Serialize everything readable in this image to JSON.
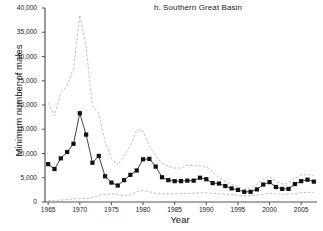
{
  "chart_data": {
    "type": "line",
    "title": "h. Southern Great Basin",
    "xlabel": "Year",
    "ylabel": "Minimum number of males",
    "xlim": [
      1964.5,
      2007.5
    ],
    "ylim": [
      0,
      40000
    ],
    "grid": false,
    "legend": null,
    "ytick_labels": [
      "0",
      "5,000",
      "10,000",
      "15,000",
      "20,000",
      "25,000",
      "30,000",
      "35,000",
      "40,000"
    ],
    "ytick_values": [
      0,
      5000,
      10000,
      15000,
      20000,
      25000,
      30000,
      35000,
      40000
    ],
    "xtick_labels": [
      "1965",
      "1970",
      "1975",
      "1980",
      "1985",
      "1990",
      "1995",
      "2000",
      "2005"
    ],
    "xtick_values": [
      1965,
      1970,
      1975,
      1980,
      1985,
      1990,
      1995,
      2000,
      2005
    ],
    "x": [
      1965,
      1966,
      1967,
      1968,
      1969,
      1970,
      1971,
      1972,
      1973,
      1974,
      1975,
      1976,
      1977,
      1978,
      1979,
      1980,
      1981,
      1982,
      1983,
      1984,
      1985,
      1986,
      1987,
      1988,
      1989,
      1990,
      1991,
      1992,
      1993,
      1994,
      1995,
      1996,
      1997,
      1998,
      1999,
      2000,
      2001,
      2002,
      2003,
      2004,
      2005,
      2006,
      2007
    ],
    "series": [
      {
        "name": "Minimum number of males",
        "style": "line-markers",
        "color": "#111111",
        "marker": "square",
        "values": [
          7800,
          6800,
          9000,
          10300,
          12000,
          18300,
          13900,
          8100,
          9500,
          5300,
          4000,
          3400,
          4500,
          5600,
          6500,
          8800,
          8900,
          7300,
          5100,
          4500,
          4300,
          4300,
          4400,
          4400,
          5000,
          4700,
          3900,
          3800,
          3300,
          2800,
          2500,
          2100,
          2100,
          2600,
          3600,
          4100,
          3100,
          2700,
          2700,
          3700,
          4300,
          4600,
          4200
        ]
      },
      {
        "name": "Upper confidence limit",
        "style": "dashed",
        "color": "#b8b8b8",
        "values": [
          20500,
          17800,
          22500,
          24000,
          27500,
          38500,
          32000,
          19800,
          18300,
          12400,
          9000,
          7600,
          9500,
          11600,
          14900,
          14600,
          11500,
          9500,
          8000,
          7400,
          7000,
          7000,
          7600,
          7400,
          7500,
          7300,
          6300,
          5000,
          4300,
          3600,
          3100,
          2700,
          2900,
          3700,
          4800,
          5300,
          4200,
          3700,
          3900,
          4900,
          5500,
          5700,
          5400
        ]
      },
      {
        "name": "Lower confidence limit",
        "style": "dashed",
        "color": "#b8b8b8",
        "values": [
          300,
          300,
          400,
          500,
          600,
          800,
          700,
          900,
          1300,
          1600,
          1700,
          1500,
          1300,
          1500,
          2100,
          2400,
          2100,
          1800,
          1700,
          1700,
          1700,
          1700,
          1800,
          1800,
          1900,
          1900,
          1800,
          1700,
          1600,
          1500,
          1400,
          1300,
          1300,
          1400,
          1600,
          1800,
          1700,
          1600,
          1600,
          1700,
          1900,
          2000,
          2000
        ]
      }
    ]
  }
}
